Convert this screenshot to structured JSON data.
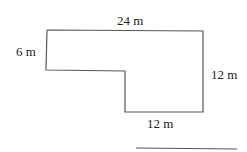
{
  "diagram": {
    "shape": "L-shaped polygon",
    "labels": {
      "top": "24 m",
      "left": "6 m",
      "right": "12 m",
      "bottom": "12 m"
    },
    "colors": {
      "stroke": "#555555",
      "text": "#222222"
    }
  }
}
